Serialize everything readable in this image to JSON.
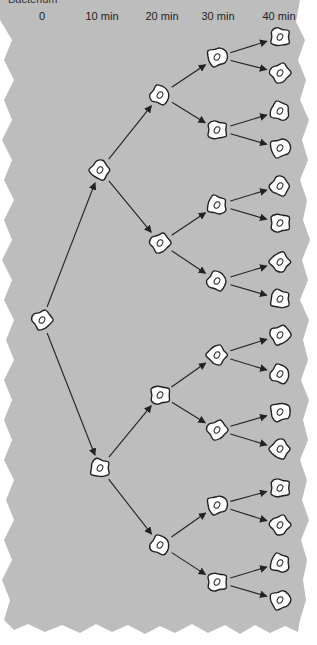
{
  "title": "Bacterium",
  "time_labels": [
    {
      "text": "0",
      "x": 42
    },
    {
      "text": "10 min",
      "x": 102
    },
    {
      "text": "20 min",
      "x": 162
    },
    {
      "text": "30 min",
      "x": 218
    },
    {
      "text": "40 min",
      "x": 279
    }
  ],
  "colors": {
    "background": "#bdbdbd",
    "cell_fill": "#ffffff",
    "stroke": "#222222"
  },
  "generations": [
    {
      "x": 42,
      "ys": [
        320
      ]
    },
    {
      "x": 100,
      "ys": [
        170,
        468
      ]
    },
    {
      "x": 160,
      "ys": [
        95,
        243,
        395,
        545
      ]
    },
    {
      "x": 217,
      "ys": [
        57,
        130,
        205,
        281,
        355,
        430,
        505,
        582
      ]
    },
    {
      "x": 280,
      "ys": [
        37,
        73,
        111,
        148,
        186,
        223,
        262,
        299,
        335,
        374,
        412,
        449,
        488,
        525,
        563,
        600
      ]
    }
  ]
}
